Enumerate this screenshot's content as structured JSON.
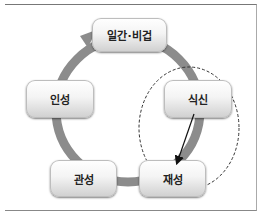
{
  "diagram": {
    "type": "cycle",
    "nodes": [
      {
        "id": "ilgan",
        "label": "일간·비겁"
      },
      {
        "id": "siksin",
        "label": "식신"
      },
      {
        "id": "jaeseong",
        "label": "재성"
      },
      {
        "id": "gwanseong",
        "label": "관성"
      },
      {
        "id": "inseong",
        "label": "인성"
      }
    ],
    "highlight": {
      "shape": "dashed-ellipse",
      "encloses": [
        "식신",
        "재성"
      ]
    },
    "arrow": {
      "from": "식신",
      "to": "재성"
    },
    "colors": {
      "ring": "#8c8c8c",
      "node_top": "#ffffff",
      "node_bottom": "#cfcfcf",
      "text": "#222222"
    }
  }
}
